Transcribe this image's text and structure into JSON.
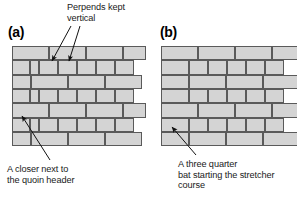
{
  "figure": {
    "type": "brickwork-bond-diagram",
    "background_color": "#ffffff",
    "brick_fill_color": "#d4d4d4",
    "brick_outline_color": "#5a5a5a",
    "text_color": "#1a1a1a"
  },
  "panels": [
    {
      "id": "a",
      "label": "(a)",
      "label_pos": {
        "x": 8,
        "y": 24
      },
      "wall": {
        "x": 12,
        "y": 46,
        "w": 118,
        "h": 86
      },
      "bond_name": "English bond with closers",
      "courses": [
        {
          "index": 0,
          "y": 0,
          "h": 14.4,
          "type": "stretcher",
          "bricks": [
            {
              "x": 0,
              "w": 37
            },
            {
              "x": 37,
              "w": 37
            },
            {
              "x": 74,
              "w": 37
            },
            {
              "x": 111,
              "w": 23
            }
          ]
        },
        {
          "index": 1,
          "y": 14.4,
          "h": 14.3,
          "type": "header",
          "bricks": [
            {
              "x": 0,
              "w": 18
            },
            {
              "x": 18,
              "w": 9
            },
            {
              "x": 27,
              "w": 19
            },
            {
              "x": 46,
              "w": 19
            },
            {
              "x": 65,
              "w": 19
            },
            {
              "x": 84,
              "w": 19
            },
            {
              "x": 103,
              "w": 19
            }
          ]
        },
        {
          "index": 2,
          "y": 28.7,
          "h": 14.3,
          "type": "stretcher",
          "bricks": [
            {
              "x": 0,
              "w": 19
            },
            {
              "x": 19,
              "w": 37
            },
            {
              "x": 56,
              "w": 37
            },
            {
              "x": 93,
              "w": 37
            }
          ]
        },
        {
          "index": 3,
          "y": 43,
          "h": 14.3,
          "type": "header",
          "bricks": [
            {
              "x": 0,
              "w": 18
            },
            {
              "x": 18,
              "w": 9
            },
            {
              "x": 27,
              "w": 19
            },
            {
              "x": 46,
              "w": 19
            },
            {
              "x": 65,
              "w": 19
            },
            {
              "x": 84,
              "w": 19
            },
            {
              "x": 103,
              "w": 19
            }
          ]
        },
        {
          "index": 4,
          "y": 57.3,
          "h": 14.3,
          "type": "stretcher",
          "bricks": [
            {
              "x": 0,
              "w": 37
            },
            {
              "x": 37,
              "w": 37
            },
            {
              "x": 74,
              "w": 37
            },
            {
              "x": 111,
              "w": 23
            }
          ]
        },
        {
          "index": 5,
          "y": 71.6,
          "h": 14.4,
          "type": "header",
          "bricks": [
            {
              "x": 0,
              "w": 18
            },
            {
              "x": 18,
              "w": 9
            },
            {
              "x": 27,
              "w": 19
            },
            {
              "x": 46,
              "w": 19
            },
            {
              "x": 65,
              "w": 19
            },
            {
              "x": 84,
              "w": 19
            },
            {
              "x": 103,
              "w": 19
            }
          ]
        },
        {
          "index": 6,
          "y": 86,
          "h": 14.3,
          "type": "stretcher",
          "bricks": [
            {
              "x": 0,
              "w": 19
            },
            {
              "x": 19,
              "w": 37
            },
            {
              "x": 56,
              "w": 37
            },
            {
              "x": 93,
              "w": 37
            }
          ]
        }
      ]
    },
    {
      "id": "b",
      "label": "(b)",
      "label_pos": {
        "x": 160,
        "y": 24
      },
      "wall": {
        "x": 161,
        "y": 46,
        "w": 124,
        "h": 86
      },
      "bond_name": "English bond with three quarter bats",
      "courses": [
        {
          "index": 0,
          "y": 0,
          "h": 14.4,
          "type": "stretcher",
          "bricks": [
            {
              "x": 0,
              "w": 37
            },
            {
              "x": 37,
              "w": 37
            },
            {
              "x": 74,
              "w": 37
            },
            {
              "x": 111,
              "w": 30
            }
          ]
        },
        {
          "index": 1,
          "y": 14.4,
          "h": 14.3,
          "type": "header",
          "bricks": [
            {
              "x": 0,
              "w": 28
            },
            {
              "x": 28,
              "w": 19
            },
            {
              "x": 47,
              "w": 19
            },
            {
              "x": 66,
              "w": 19
            },
            {
              "x": 85,
              "w": 19
            },
            {
              "x": 104,
              "w": 19
            }
          ]
        },
        {
          "index": 2,
          "y": 28.7,
          "h": 14.3,
          "type": "stretcher",
          "bricks": [
            {
              "x": 0,
              "w": 28
            },
            {
              "x": 28,
              "w": 37
            },
            {
              "x": 65,
              "w": 37
            },
            {
              "x": 102,
              "w": 37
            }
          ]
        },
        {
          "index": 3,
          "y": 43,
          "h": 14.3,
          "type": "header",
          "bricks": [
            {
              "x": 0,
              "w": 28
            },
            {
              "x": 28,
              "w": 19
            },
            {
              "x": 47,
              "w": 19
            },
            {
              "x": 66,
              "w": 19
            },
            {
              "x": 85,
              "w": 19
            },
            {
              "x": 104,
              "w": 19
            }
          ]
        },
        {
          "index": 4,
          "y": 57.3,
          "h": 14.3,
          "type": "stretcher",
          "bricks": [
            {
              "x": 0,
              "w": 37
            },
            {
              "x": 37,
              "w": 37
            },
            {
              "x": 74,
              "w": 37
            },
            {
              "x": 111,
              "w": 30
            }
          ]
        },
        {
          "index": 5,
          "y": 71.6,
          "h": 14.4,
          "type": "header",
          "bricks": [
            {
              "x": 0,
              "w": 28
            },
            {
              "x": 28,
              "w": 19
            },
            {
              "x": 47,
              "w": 19
            },
            {
              "x": 66,
              "w": 19
            },
            {
              "x": 85,
              "w": 19
            },
            {
              "x": 104,
              "w": 19
            }
          ]
        },
        {
          "index": 6,
          "y": 86,
          "h": 14.3,
          "type": "stretcher",
          "bricks": [
            {
              "x": 0,
              "w": 28
            },
            {
              "x": 28,
              "w": 37
            },
            {
              "x": 65,
              "w": 37
            },
            {
              "x": 102,
              "w": 37
            }
          ]
        }
      ]
    }
  ],
  "annotations": [
    {
      "id": "perpends",
      "text": "Perpends kept\nvertical",
      "pos": {
        "x": 67,
        "y": 2
      },
      "arrows": [
        {
          "x1": 71,
          "y1": 26,
          "x2": 52,
          "y2": 61
        },
        {
          "x1": 80,
          "y1": 26,
          "x2": 69,
          "y2": 61
        }
      ]
    },
    {
      "id": "closer",
      "text": "A closer next to\nthe quoin header",
      "pos": {
        "x": 7,
        "y": 164
      },
      "arrows": [
        {
          "x1": 50,
          "y1": 160,
          "x2": 22,
          "y2": 116
        }
      ]
    },
    {
      "id": "three-quarter-bat",
      "text": "A three quarter\nbat starting the stretcher\ncourse",
      "pos": {
        "x": 178,
        "y": 159
      },
      "arrows": [
        {
          "x1": 196,
          "y1": 155,
          "x2": 172,
          "y2": 127
        }
      ]
    }
  ]
}
